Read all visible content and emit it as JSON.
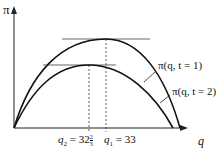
{
  "axes": {
    "y_label": "π",
    "x_label": "q"
  },
  "curves": [
    {
      "name": "profit-curve-t1",
      "label": "π(q, t = 1)",
      "peak_q_label": "q",
      "peak_q_sub": "1",
      "peak_q_value": "= 33"
    },
    {
      "name": "profit-curve-t2",
      "label": "π(q, t = 2)",
      "peak_q_label": "q",
      "peak_q_sub": "2",
      "peak_q_value": "= 32",
      "peak_q_frac_num": "2",
      "peak_q_frac_den": "3"
    }
  ],
  "colors": {
    "line": "#111111",
    "tangent": "#555555",
    "background": "#ffffff"
  }
}
